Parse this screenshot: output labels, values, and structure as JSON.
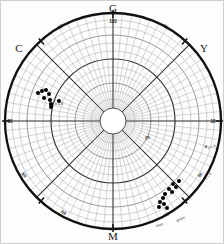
{
  "chart_data": {
    "type": "scatter",
    "plot_style": "polar",
    "title": "",
    "subtitle": "",
    "xlabel": "",
    "ylabel": "",
    "grid": true,
    "legend_position": "none",
    "center": {
      "cx": 112,
      "cy": 120
    },
    "outer_radius": 108,
    "hub_radius": 13,
    "angular_axis": {
      "units": "hue angle (degrees)",
      "cardinal_labels": [
        {
          "key": "G",
          "label": "G",
          "angle_deg": 90,
          "x": 112,
          "y": 11
        },
        {
          "key": "Y",
          "label": "Y",
          "angle_deg": 35,
          "x": 203,
          "y": 51
        },
        {
          "key": "M",
          "label": "M",
          "angle_deg": 270,
          "x": 112,
          "y": 239
        },
        {
          "key": "C",
          "label": "C",
          "angle_deg": 145,
          "x": 18,
          "y": 51
        }
      ]
    },
    "radial_rings": [
      {
        "r": 13,
        "weight": "hub"
      },
      {
        "r": 22,
        "weight": "fine"
      },
      {
        "r": 30,
        "weight": "fine"
      },
      {
        "r": 38,
        "weight": "mid"
      },
      {
        "r": 46,
        "weight": "fine"
      },
      {
        "r": 54,
        "weight": "fine"
      },
      {
        "r": 62,
        "weight": "major"
      },
      {
        "r": 70,
        "weight": "fine"
      },
      {
        "r": 78,
        "weight": "fine"
      },
      {
        "r": 86,
        "weight": "mid"
      },
      {
        "r": 94,
        "weight": "fine"
      },
      {
        "r": 101,
        "weight": "fine"
      },
      {
        "r": 108,
        "weight": "rim"
      }
    ],
    "tick_labels": [
      {
        "text": "100",
        "x": 112,
        "y": 22,
        "rot": 0,
        "size": "num"
      },
      {
        "text": "50",
        "x": 60,
        "y": 27,
        "rot": -38,
        "size": "num"
      },
      {
        "text": "50",
        "x": 164,
        "y": 27,
        "rot": 38,
        "size": "num"
      },
      {
        "text": "50",
        "x": 9,
        "y": 122,
        "rot": 0,
        "size": "num"
      },
      {
        "text": "10",
        "x": 212,
        "y": 122,
        "rot": 0,
        "size": "num"
      },
      {
        "text": "0",
        "x": 205,
        "y": 147,
        "rot": 0,
        "size": "num-sm"
      },
      {
        "text": "50",
        "x": 22,
        "y": 175,
        "rot": 48,
        "size": "num"
      },
      {
        "text": "50",
        "x": 200,
        "y": 175,
        "rot": -48,
        "size": "num-sm"
      },
      {
        "text": "50",
        "x": 62,
        "y": 213,
        "rot": 28,
        "size": "num"
      },
      {
        "text": "50",
        "x": 166,
        "y": 215,
        "rot": -22,
        "size": "num-sm"
      },
      {
        "text": "0",
        "x": 112,
        "y": 228,
        "rot": 0,
        "size": "num-sm"
      },
      {
        "text": "50",
        "x": 147,
        "y": 138,
        "rot": -20,
        "size": "num-sm"
      }
    ],
    "annotations": [
      {
        "text": "n = 9",
        "x": 211,
        "y": 147,
        "rot": -20
      },
      {
        "text": "n = 9",
        "x": 208,
        "y": 176,
        "rot": -48
      },
      {
        "text": "blue",
        "x": 159,
        "y": 225,
        "rot": -22
      },
      {
        "text": "green",
        "x": 180,
        "y": 219,
        "rot": -22
      },
      {
        "text": "n = 8",
        "x": 58,
        "y": 104,
        "rot": 0
      }
    ],
    "series": [
      {
        "name": "cluster-upper-left",
        "color": "#000000",
        "marker": "circle",
        "marker_size": 2.0,
        "points": [
          {
            "x": 37,
            "y": 92
          },
          {
            "x": 41,
            "y": 90
          },
          {
            "x": 45,
            "y": 89
          },
          {
            "x": 48,
            "y": 93
          },
          {
            "x": 43,
            "y": 97
          },
          {
            "x": 49,
            "y": 99
          },
          {
            "x": 50,
            "y": 103
          },
          {
            "x": 50,
            "y": 106
          },
          {
            "x": 58,
            "y": 100
          }
        ]
      },
      {
        "name": "cluster-lower-right",
        "color": "#000000",
        "marker": "circle",
        "marker_size": 2.0,
        "points": [
          {
            "x": 178,
            "y": 180
          },
          {
            "x": 172,
            "y": 183
          },
          {
            "x": 175,
            "y": 186
          },
          {
            "x": 168,
            "y": 188
          },
          {
            "x": 171,
            "y": 191
          },
          {
            "x": 164,
            "y": 193
          },
          {
            "x": 162,
            "y": 197
          },
          {
            "x": 159,
            "y": 201
          },
          {
            "x": 163,
            "y": 203
          },
          {
            "x": 158,
            "y": 206
          },
          {
            "x": 166,
            "y": 207
          }
        ]
      }
    ]
  }
}
